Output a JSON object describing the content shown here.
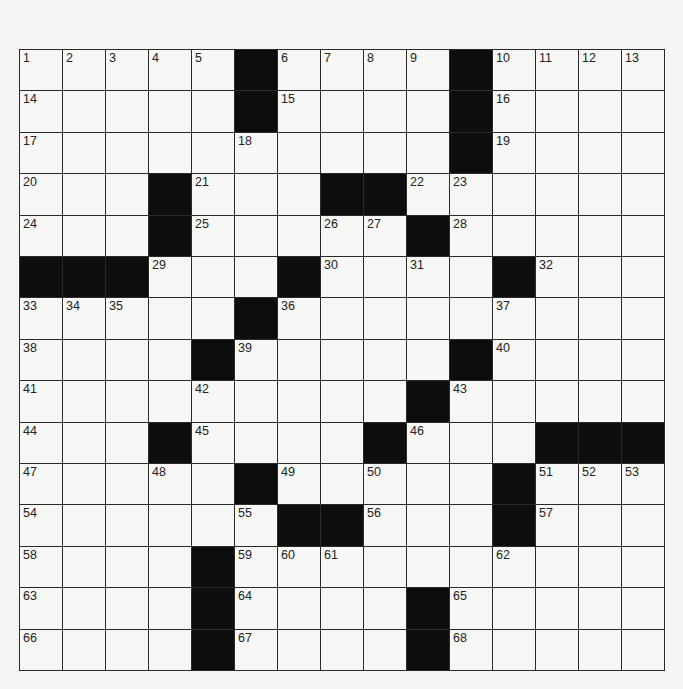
{
  "puzzle": {
    "rows": 15,
    "cols": 15,
    "colors": {
      "black": "#0d0d0d",
      "white": "#f7f7f5",
      "line": "#2a2a2a"
    },
    "grid": [
      "....#....#....",
      "....#....#....",
      "..........#....",
      "...#...##......",
      "...#...#.#.....",
      "###...#...#....",
      ".....#.........",
      "....#.....#....",
      ".........#.....",
      "...#....#...###",
      "...#.#.........",
      "......##...#...",
      "....#..........",
      "....#....#.....",
      "....#....#....."
    ],
    "blacks": [
      [
        0,
        5
      ],
      [
        0,
        10
      ],
      [
        1,
        5
      ],
      [
        1,
        10
      ],
      [
        2,
        10
      ],
      [
        3,
        3
      ],
      [
        3,
        7
      ],
      [
        3,
        8
      ],
      [
        4,
        3
      ],
      [
        4,
        9
      ],
      [
        5,
        0
      ],
      [
        5,
        1
      ],
      [
        5,
        2
      ],
      [
        5,
        6
      ],
      [
        5,
        11
      ],
      [
        6,
        5
      ],
      [
        7,
        4
      ],
      [
        7,
        10
      ],
      [
        8,
        9
      ],
      [
        9,
        3
      ],
      [
        9,
        8
      ],
      [
        9,
        12
      ],
      [
        9,
        13
      ],
      [
        9,
        14
      ],
      [
        10,
        5
      ],
      [
        10,
        11
      ],
      [
        11,
        6
      ],
      [
        11,
        7
      ],
      [
        11,
        11
      ],
      [
        12,
        4
      ],
      [
        13,
        4
      ],
      [
        13,
        9
      ],
      [
        14,
        4
      ],
      [
        14,
        9
      ]
    ],
    "numbers": [
      {
        "r": 0,
        "c": 0,
        "n": "1"
      },
      {
        "r": 0,
        "c": 1,
        "n": "2"
      },
      {
        "r": 0,
        "c": 2,
        "n": "3"
      },
      {
        "r": 0,
        "c": 3,
        "n": "4"
      },
      {
        "r": 0,
        "c": 4,
        "n": "5"
      },
      {
        "r": 0,
        "c": 6,
        "n": "6"
      },
      {
        "r": 0,
        "c": 7,
        "n": "7"
      },
      {
        "r": 0,
        "c": 8,
        "n": "8"
      },
      {
        "r": 0,
        "c": 9,
        "n": "9"
      },
      {
        "r": 0,
        "c": 11,
        "n": "10"
      },
      {
        "r": 0,
        "c": 12,
        "n": "11"
      },
      {
        "r": 0,
        "c": 13,
        "n": "12"
      },
      {
        "r": 0,
        "c": 14,
        "n": "13"
      },
      {
        "r": 1,
        "c": 0,
        "n": "14"
      },
      {
        "r": 1,
        "c": 6,
        "n": "15"
      },
      {
        "r": 1,
        "c": 11,
        "n": "16"
      },
      {
        "r": 2,
        "c": 0,
        "n": "17"
      },
      {
        "r": 2,
        "c": 5,
        "n": "18"
      },
      {
        "r": 2,
        "c": 11,
        "n": "19"
      },
      {
        "r": 3,
        "c": 0,
        "n": "20"
      },
      {
        "r": 3,
        "c": 4,
        "n": "21"
      },
      {
        "r": 3,
        "c": 9,
        "n": "22"
      },
      {
        "r": 3,
        "c": 10,
        "n": "23"
      },
      {
        "r": 4,
        "c": 0,
        "n": "24"
      },
      {
        "r": 4,
        "c": 4,
        "n": "25"
      },
      {
        "r": 4,
        "c": 7,
        "n": "26"
      },
      {
        "r": 4,
        "c": 8,
        "n": "27"
      },
      {
        "r": 4,
        "c": 10,
        "n": "28"
      },
      {
        "r": 5,
        "c": 3,
        "n": "29"
      },
      {
        "r": 5,
        "c": 7,
        "n": "30"
      },
      {
        "r": 5,
        "c": 9,
        "n": "31"
      },
      {
        "r": 5,
        "c": 12,
        "n": "32"
      },
      {
        "r": 6,
        "c": 0,
        "n": "33"
      },
      {
        "r": 6,
        "c": 1,
        "n": "34"
      },
      {
        "r": 6,
        "c": 2,
        "n": "35"
      },
      {
        "r": 6,
        "c": 6,
        "n": "36"
      },
      {
        "r": 6,
        "c": 11,
        "n": "37"
      },
      {
        "r": 7,
        "c": 0,
        "n": "38"
      },
      {
        "r": 7,
        "c": 5,
        "n": "39"
      },
      {
        "r": 7,
        "c": 11,
        "n": "40"
      },
      {
        "r": 8,
        "c": 0,
        "n": "41"
      },
      {
        "r": 8,
        "c": 4,
        "n": "42"
      },
      {
        "r": 8,
        "c": 10,
        "n": "43"
      },
      {
        "r": 9,
        "c": 0,
        "n": "44"
      },
      {
        "r": 9,
        "c": 4,
        "n": "45"
      },
      {
        "r": 9,
        "c": 9,
        "n": "46"
      },
      {
        "r": 10,
        "c": 0,
        "n": "47"
      },
      {
        "r": 10,
        "c": 3,
        "n": "48"
      },
      {
        "r": 10,
        "c": 6,
        "n": "49"
      },
      {
        "r": 10,
        "c": 8,
        "n": "50"
      },
      {
        "r": 10,
        "c": 12,
        "n": "51"
      },
      {
        "r": 10,
        "c": 13,
        "n": "52"
      },
      {
        "r": 10,
        "c": 14,
        "n": "53"
      },
      {
        "r": 11,
        "c": 0,
        "n": "54"
      },
      {
        "r": 11,
        "c": 5,
        "n": "55"
      },
      {
        "r": 11,
        "c": 8,
        "n": "56"
      },
      {
        "r": 11,
        "c": 12,
        "n": "57"
      },
      {
        "r": 12,
        "c": 0,
        "n": "58"
      },
      {
        "r": 12,
        "c": 5,
        "n": "59"
      },
      {
        "r": 12,
        "c": 6,
        "n": "60"
      },
      {
        "r": 12,
        "c": 7,
        "n": "61"
      },
      {
        "r": 12,
        "c": 11,
        "n": "62"
      },
      {
        "r": 13,
        "c": 0,
        "n": "63"
      },
      {
        "r": 13,
        "c": 5,
        "n": "64"
      },
      {
        "r": 13,
        "c": 10,
        "n": "65"
      },
      {
        "r": 14,
        "c": 0,
        "n": "66"
      },
      {
        "r": 14,
        "c": 5,
        "n": "67"
      },
      {
        "r": 14,
        "c": 10,
        "n": "68"
      }
    ]
  }
}
